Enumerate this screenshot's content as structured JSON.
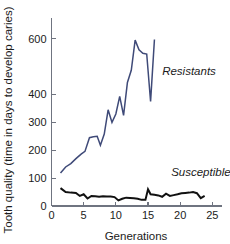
{
  "chart_data": {
    "type": "line",
    "title": "",
    "xlabel": "Generations",
    "ylabel": "Tooth quality (time in days to develop caries)",
    "xlim": [
      0,
      26.5
    ],
    "ylim": [
      0,
      660
    ],
    "grid": false,
    "legend": "inline-annotations",
    "xticks": [
      0,
      5,
      10,
      15,
      20,
      25
    ],
    "xticklabels": [
      "0",
      "5",
      "10",
      "15",
      "20",
      "25"
    ],
    "yticks": [
      0,
      100,
      200,
      300,
      400,
      600
    ],
    "yticklabels": [
      "0",
      "100",
      "200",
      "300",
      "400",
      "600"
    ],
    "series": [
      {
        "name": "Resistants",
        "color": "#3f4a78",
        "label_x": 17.2,
        "label_y": 470,
        "x": [
          1.4,
          2.2,
          3.0,
          3.8,
          4.6,
          5.2,
          5.9,
          6.5,
          7.1,
          7.6,
          8.2,
          8.8,
          9.4,
          10.0,
          10.6,
          11.2,
          11.8,
          12.4,
          13.0,
          13.6,
          14.2,
          14.8,
          15.4,
          16.0
        ],
        "y": [
          118,
          140,
          152,
          170,
          186,
          196,
          245,
          248,
          250,
          218,
          258,
          345,
          300,
          330,
          393,
          325,
          443,
          487,
          595,
          560,
          548,
          545,
          375,
          597
        ]
      },
      {
        "name": "Susceptibles",
        "color": "#111111",
        "label_x": 18.6,
        "label_y": 108,
        "x": [
          1.4,
          2.2,
          3.0,
          3.8,
          4.4,
          5.0,
          5.6,
          6.2,
          6.8,
          7.4,
          8.0,
          8.6,
          9.2,
          9.8,
          10.4,
          11.0,
          11.6,
          12.2,
          12.8,
          13.4,
          14.0,
          14.6,
          15.0,
          15.4,
          16.0,
          16.6,
          17.2,
          17.8,
          18.4,
          19.0,
          19.6,
          20.2,
          20.8,
          21.4,
          22.0,
          22.6,
          23.2,
          23.8
        ],
        "y": [
          64,
          50,
          48,
          47,
          36,
          42,
          27,
          36,
          35,
          33,
          35,
          34,
          34,
          32,
          20,
          26,
          30,
          29,
          28,
          26,
          22,
          22,
          60,
          42,
          40,
          38,
          33,
          44,
          36,
          39,
          42,
          46,
          47,
          48,
          50,
          46,
          28,
          36
        ]
      }
    ]
  }
}
